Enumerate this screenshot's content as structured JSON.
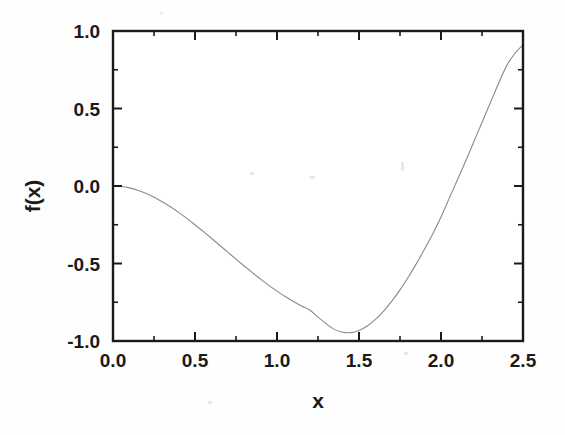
{
  "figure": {
    "background_color": "#fefefe",
    "frame_color": "#1a1a1a",
    "curve_color": "#8a8a8a"
  },
  "chart_data": {
    "type": "line",
    "title": "",
    "subtitle": "",
    "xlabel": "x",
    "ylabel": "f(x)",
    "xlim": [
      0.0,
      2.5
    ],
    "ylim": [
      -1.0,
      1.0
    ],
    "xticks": [
      0.0,
      0.5,
      1.0,
      1.5,
      2.0,
      2.5
    ],
    "yticks": [
      -1.0,
      -0.5,
      0.0,
      0.5,
      1.0
    ],
    "xticklabels": [
      "0.0",
      "0.5",
      "1.0",
      "1.5",
      "2.0",
      "2.5"
    ],
    "yticklabels": [
      "-1.0",
      "-0.5",
      "0.0",
      "0.5",
      "1.0"
    ],
    "grid": false,
    "legend": null,
    "tick_direction": "in",
    "series": [
      {
        "name": "f(x)",
        "color": "#8a8a8a",
        "line_width": 1.1,
        "x": [
          0.0,
          0.05,
          0.1,
          0.15,
          0.2,
          0.25,
          0.3,
          0.35,
          0.4,
          0.45,
          0.5,
          0.55,
          0.6,
          0.65,
          0.7,
          0.75,
          0.8,
          0.85,
          0.9,
          0.95,
          1.0,
          1.05,
          1.1,
          1.15,
          1.2,
          1.25,
          1.3,
          1.35,
          1.4,
          1.45,
          1.5,
          1.55,
          1.6,
          1.65,
          1.7,
          1.75,
          1.8,
          1.85,
          1.9,
          1.95,
          2.0,
          2.05,
          2.1,
          2.15,
          2.2,
          2.25,
          2.3,
          2.35,
          2.4,
          2.45,
          2.5
        ],
        "y": [
          0.0,
          -0.003,
          -0.012,
          -0.027,
          -0.047,
          -0.072,
          -0.101,
          -0.134,
          -0.17,
          -0.209,
          -0.25,
          -0.293,
          -0.337,
          -0.382,
          -0.427,
          -0.472,
          -0.516,
          -0.559,
          -0.601,
          -0.641,
          -0.678,
          -0.713,
          -0.745,
          -0.774,
          -0.8,
          -0.846,
          -0.889,
          -0.925,
          -0.944,
          -0.946,
          -0.932,
          -0.903,
          -0.861,
          -0.807,
          -0.743,
          -0.67,
          -0.589,
          -0.501,
          -0.407,
          -0.308,
          -0.2,
          -0.08,
          0.04,
          0.16,
          0.285,
          0.41,
          0.535,
          0.66,
          0.775,
          0.855,
          0.91
        ]
      }
    ]
  },
  "axis_titles": {
    "x": "x",
    "y": "f(x)"
  }
}
